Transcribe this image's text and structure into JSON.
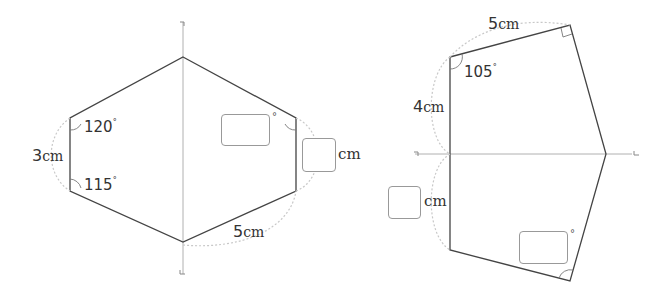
{
  "figures": [
    {
      "id": "left",
      "shape": "hexagon symmetric about a vertical axis",
      "labels": {
        "side_left": {
          "value": "3",
          "unit": "cm"
        },
        "angle_upper_left": {
          "value": "120",
          "unit": "°"
        },
        "angle_lower_left": {
          "value": "115",
          "unit": "°"
        },
        "side_bottom_right": {
          "value": "5",
          "unit": "cm"
        },
        "answer_angle": {
          "value": "",
          "unit": "°"
        },
        "answer_side": {
          "value": "",
          "unit": "cm"
        }
      }
    },
    {
      "id": "right",
      "shape": "pentagon symmetric about a horizontal axis",
      "labels": {
        "side_top": {
          "value": "5",
          "unit": "cm"
        },
        "angle_top_left": {
          "value": "105",
          "unit": "°"
        },
        "side_left_upper": {
          "value": "4",
          "unit": "cm"
        },
        "answer_side": {
          "value": "",
          "unit": "cm"
        },
        "answer_angle": {
          "value": "",
          "unit": "°"
        }
      }
    }
  ],
  "colors": {
    "outline": "#444444",
    "axis": "#b0b0b0",
    "dotted": "#c8c8c8",
    "box_border": "#999999"
  }
}
